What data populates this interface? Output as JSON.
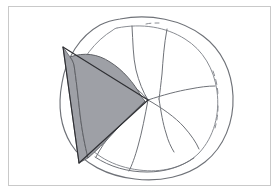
{
  "figure": {
    "background_color": "#ffffff",
    "canvas": {
      "width": 279,
      "height": 194
    }
  },
  "frame": {
    "name": "outer-frame",
    "x": 8,
    "y": 6,
    "width": 263,
    "height": 180,
    "stroke_color": "#c9c9c9",
    "stroke_width": 1,
    "fill": "none"
  },
  "palette": {
    "shaded_fill": "#9ea0a6",
    "shaded_stroke": "#5f6166",
    "surface_stroke": "#6f7278",
    "surface_stroke_light": "#8a8d93",
    "cone_stroke": "#2e2f33",
    "frame_stroke": "#c9c9c9"
  },
  "strokes": {
    "blob_outer_width": 1.15,
    "blob_inner_width": 1.0,
    "surface_curve_width": 1.0,
    "cone_edge_width": 1.15,
    "shaded_edge_width": 1.0,
    "dash_pattern": "5 4"
  },
  "shapes": {
    "blob_outer": {
      "name": "blob-outer-contour",
      "d": "M 120 19 C 150 13 182 20 203 36 C 222 50 232 72 233 96 C 234 122 224 147 205 162 C 186 177 160 182 135 179 C 108 176 83 164 71 144 C 60 126 58 104 62 83 C 66 58 80 36 100 25 C 106 22 113 20 120 19 Z"
    },
    "blob_inner_solid": {
      "name": "blob-inner-contour-visible",
      "d": "M 117 28 C 142 23 166 27 185 39 C 203 50 214 69 217 91 C 220 114 214 137 199 153 C 184 168 161 173 139 170 C 114 167 92 155 81 137 C 71 120 70 100 75 81 C 80 60 95 41 113 30 C 114 29 116 28 117 28"
    },
    "blob_inner_dashed": {
      "name": "blob-inner-contour-hidden",
      "segments": [
        "M 146 24 C 150 23 155 23 159 23",
        "M 213 71 C 216 79 218 88 218 97",
        "M 218 106 C 218 114 217 121 215 128"
      ]
    },
    "surface_curves": [
      {
        "name": "surface-curve-upper-left",
        "d": "M 74 57 C 92 63 110 69 124 79 C 134 86 142 93 148 100"
      },
      {
        "name": "surface-curve-upper-mid",
        "d": "M 132 26 C 133 42 133 57 136 70 C 139 82 143 92 148 100"
      },
      {
        "name": "surface-curve-upper-right",
        "d": "M 167 29 C 164 45 163 60 162 74 C 161 83 160 92 159 99"
      },
      {
        "name": "surface-curve-right-upper",
        "d": "M 148 100 C 163 95 178 91 190 89 C 200 87 208 86 215 86"
      },
      {
        "name": "surface-curve-right-lower",
        "d": "M 148 100 C 162 108 175 117 184 127 C 191 135 196 142 199 149"
      },
      {
        "name": "surface-curve-lower-mid",
        "d": "M 148 100 C 145 116 142 132 138 146 C 135 157 132 165 129 171"
      },
      {
        "name": "surface-curve-lower-left",
        "d": "M 148 100 C 136 110 123 120 114 131 C 106 140 100 149 96 157"
      },
      {
        "name": "surface-curve-lower-short",
        "d": "M 159 99 C 161 112 163 124 166 133 C 168 141 171 147 174 152"
      },
      {
        "name": "surface-curve-bottom-rim",
        "d": "M 95 157 C 110 167 128 172 147 172 C 165 172 181 167 194 158"
      }
    ],
    "cone": {
      "name": "cone-triangle",
      "apex_vertices": [
        {
          "name": "cone-vertex-top-left",
          "x": 63,
          "y": 47
        },
        {
          "name": "cone-vertex-right-apex",
          "x": 148,
          "y": 100
        },
        {
          "name": "cone-vertex-bottom-left",
          "x": 79,
          "y": 163
        }
      ],
      "edges": [
        {
          "name": "cone-edge-top",
          "d": "M 63 47 L 148 100"
        },
        {
          "name": "cone-edge-bottom",
          "d": "M 148 100 L 79 163"
        },
        {
          "name": "cone-edge-left",
          "d": "M 63 47 L 79 163"
        }
      ]
    },
    "shaded_region": {
      "name": "shaded-curvilinear-triangle",
      "d": "M 70 57 C 84 52 98 54 110 62 C 123 70 134 83 141 96 C 143 99 144 100 145 101 C 136 110 125 120 116 130 C 105 142 95 152 88 158 C 85 146 82 131 80 114 C 78 96 76 78 74 65 C 73 61 71 58 70 57 Z",
      "fill": "#9ea0a6",
      "stroke": "#5f6166"
    },
    "shaded_left_sliver": {
      "name": "shaded-left-sliver",
      "d": "M 70 57 C 71 58 73 61 74 65 C 76 78 78 96 80 114 C 82 131 85 146 88 158 L 79 163 L 63 47 Z"
    }
  },
  "labels": {
    "has_text_labels": false,
    "annotations": []
  }
}
